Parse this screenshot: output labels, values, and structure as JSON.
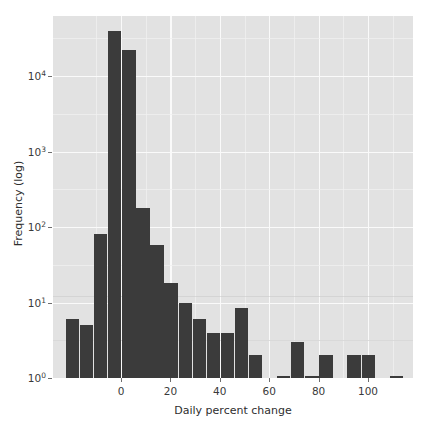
{
  "chart_data": {
    "type": "bar",
    "title": "",
    "subtitle": "",
    "xlabel": "Daily percent change",
    "ylabel": "Frequency (log)",
    "yscale": "log",
    "xlim": [
      -25.5,
      120
    ],
    "ylim": [
      1,
      62000
    ],
    "grid": true,
    "legend": null,
    "bar_color": "#3b3b3b",
    "panel_color": "#e2e2e2",
    "gridline_color": "#fafafa",
    "x_tick_labels": [
      "0",
      "20",
      "40",
      "60",
      "80",
      "100"
    ],
    "x_tick_values": [
      0,
      20,
      40,
      60,
      80,
      100
    ],
    "y_tick_labels": [
      "10⁰",
      "10¹",
      "10²",
      "10³",
      "10⁴"
    ],
    "y_tick_values": [
      1,
      10,
      100,
      1000,
      10000
    ],
    "bin_width": 5.7,
    "bins": [
      {
        "x0": -22.3,
        "x1": -16.6,
        "value": 6
      },
      {
        "x0": -16.6,
        "x1": -10.9,
        "value": 5
      },
      {
        "x0": -10.9,
        "x1": -5.2,
        "value": 80
      },
      {
        "x0": -5.2,
        "x1": 0.5,
        "value": 40000
      },
      {
        "x0": 0.5,
        "x1": 6.2,
        "value": 22000
      },
      {
        "x0": 6.2,
        "x1": 11.9,
        "value": 180
      },
      {
        "x0": 11.9,
        "x1": 17.6,
        "value": 57
      },
      {
        "x0": 17.6,
        "x1": 23.3,
        "value": 18
      },
      {
        "x0": 23.3,
        "x1": 29.0,
        "value": 10
      },
      {
        "x0": 29.0,
        "x1": 34.7,
        "value": 6
      },
      {
        "x0": 34.7,
        "x1": 40.4,
        "value": 4
      },
      {
        "x0": 40.4,
        "x1": 46.1,
        "value": 4
      },
      {
        "x0": 46.1,
        "x1": 51.8,
        "value": 8.5
      },
      {
        "x0": 51.8,
        "x1": 57.5,
        "value": 2
      },
      {
        "x0": 57.5,
        "x1": 63.2,
        "value": 0
      },
      {
        "x0": 63.2,
        "x1": 68.9,
        "value": 1
      },
      {
        "x0": 68.9,
        "x1": 74.6,
        "value": 3
      },
      {
        "x0": 74.6,
        "x1": 80.3,
        "value": 1
      },
      {
        "x0": 80.3,
        "x1": 86.0,
        "value": 2
      },
      {
        "x0": 86.0,
        "x1": 91.7,
        "value": 0
      },
      {
        "x0": 91.7,
        "x1": 97.4,
        "value": 2
      },
      {
        "x0": 97.4,
        "x1": 103.1,
        "value": 2
      },
      {
        "x0": 103.1,
        "x1": 108.8,
        "value": 0
      },
      {
        "x0": 108.8,
        "x1": 114.5,
        "value": 1
      }
    ]
  }
}
